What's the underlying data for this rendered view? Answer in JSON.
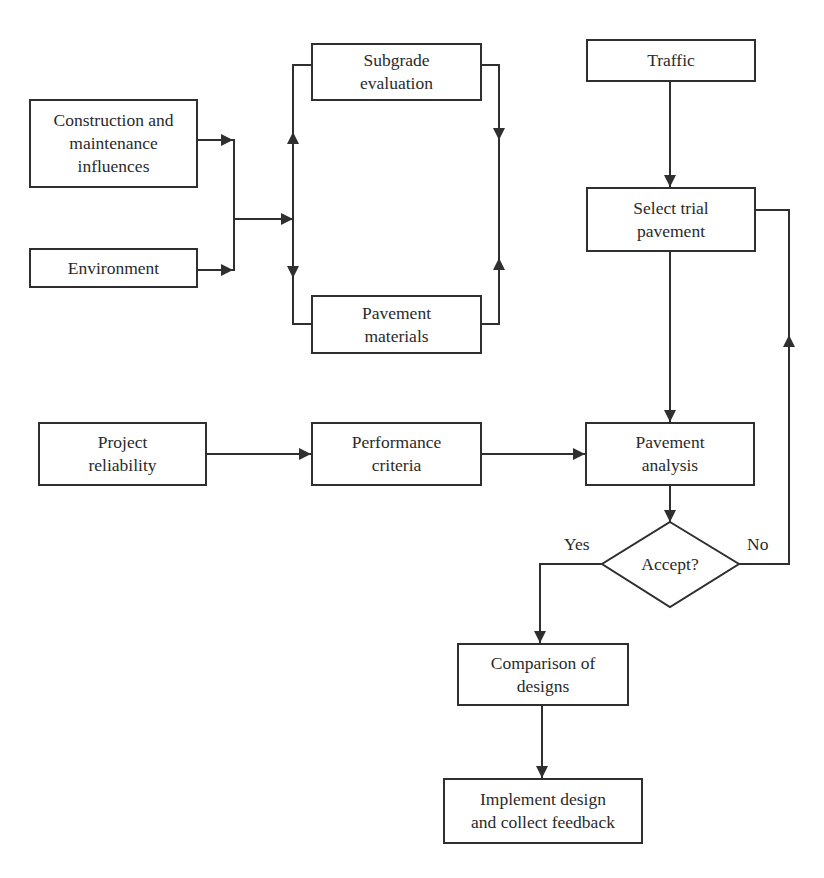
{
  "diagram": {
    "nodes": {
      "construction": {
        "label": "Construction and\nmaintenance\ninfluences"
      },
      "environment": {
        "label": "Environment"
      },
      "subgrade": {
        "label": "Subgrade\nevaluation"
      },
      "materials": {
        "label": "Pavement\nmaterials"
      },
      "traffic": {
        "label": "Traffic"
      },
      "trial": {
        "label": "Select trial\npavement"
      },
      "reliability": {
        "label": "Project\nreliability"
      },
      "criteria": {
        "label": "Performance\ncriteria"
      },
      "analysis": {
        "label": "Pavement\nanalysis"
      },
      "accept": {
        "label": "Accept?"
      },
      "comparison": {
        "label": "Comparison of\ndesigns"
      },
      "implement": {
        "label": "Implement design\nand collect feedback"
      }
    },
    "edge_labels": {
      "yes": "Yes",
      "no": "No"
    },
    "edges": [
      {
        "from": "Construction and maintenance influences",
        "to": "Subgrade evaluation / Pavement materials loop"
      },
      {
        "from": "Environment",
        "to": "Subgrade evaluation / Pavement materials loop"
      },
      {
        "from": "Subgrade evaluation",
        "to": "Pavement materials"
      },
      {
        "from": "Pavement materials",
        "to": "Subgrade evaluation"
      },
      {
        "from": "Traffic",
        "to": "Select trial pavement"
      },
      {
        "from": "Select trial pavement",
        "to": "Pavement analysis"
      },
      {
        "from": "Project reliability",
        "to": "Performance criteria"
      },
      {
        "from": "Performance criteria",
        "to": "Pavement analysis"
      },
      {
        "from": "Pavement analysis",
        "to": "Accept?"
      },
      {
        "from": "Accept?",
        "to": "Comparison of designs",
        "label": "Yes"
      },
      {
        "from": "Accept?",
        "to": "Select trial pavement",
        "label": "No"
      },
      {
        "from": "Comparison of designs",
        "to": "Implement design and collect feedback"
      }
    ],
    "colors": {
      "stroke": "#2f2f2f",
      "background": "#ffffff",
      "text": "#2a2a2a"
    }
  }
}
